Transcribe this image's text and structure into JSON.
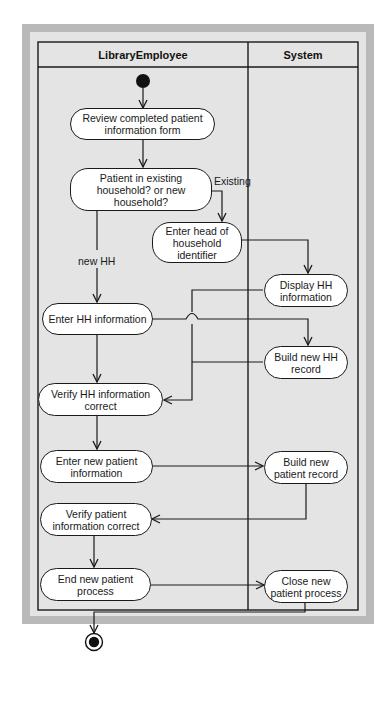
{
  "diagram": {
    "type": "UML activity diagram",
    "colors": {
      "frame": "#b9b9b9",
      "background": "#e4e4e4",
      "node_fill": "#ffffff",
      "stroke": "#1a1a1a"
    },
    "swimlanes": [
      {
        "id": "employee",
        "title": "LibraryEmployee"
      },
      {
        "id": "system",
        "title": "System"
      }
    ],
    "nodes": {
      "review": "Review completed patient information form",
      "decision": "Patient in existing household? or new household?",
      "enter_head": "Enter head of household identifier",
      "display_hh": "Display HH information",
      "enter_hh": "Enter HH information",
      "build_hh": "Build new HH record",
      "verify_hh": "Verify HH information correct",
      "enter_patient": "Enter new patient information",
      "build_patient": "Build new patient record",
      "verify_patient": "Verify patient information correct",
      "end_process": "End new patient process",
      "close_process": "Close new patient process"
    },
    "edge_labels": {
      "existing": "Existing",
      "new_hh": "new HH"
    },
    "markers": {
      "start": "initial-node",
      "end": "final-node"
    }
  }
}
